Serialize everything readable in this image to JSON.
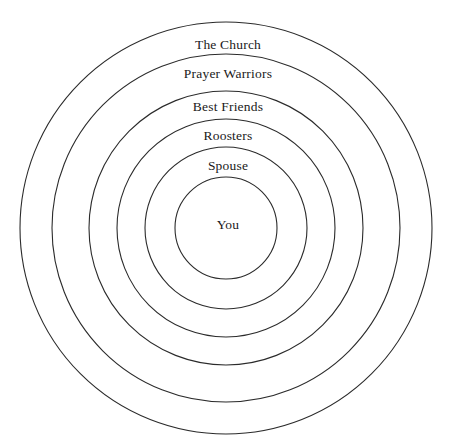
{
  "diagram": {
    "type": "concentric-circles",
    "background_color": "#ffffff",
    "stroke_color": "#2b2b2b",
    "stroke_width": 1.1,
    "text_color": "#1a1a1a",
    "center": {
      "x": 226,
      "y": 228
    },
    "rings": [
      {
        "index": 0,
        "label": "The Church",
        "radius": 206,
        "label_y": 38,
        "font_size": 13.5,
        "level": "outermost"
      },
      {
        "index": 1,
        "label": "Prayer Warriors",
        "radius": 174,
        "label_y": 67,
        "font_size": 13.5,
        "level": "second"
      },
      {
        "index": 2,
        "label": "Best Friends",
        "radius": 137,
        "label_y": 100,
        "font_size": 13.5,
        "level": "third"
      },
      {
        "index": 3,
        "label": "Roosters",
        "radius": 109,
        "label_y": 129,
        "font_size": 13.5,
        "level": "fourth"
      },
      {
        "index": 4,
        "label": "Spouse",
        "radius": 81,
        "label_y": 159,
        "font_size": 13.5,
        "level": "fifth"
      },
      {
        "index": 5,
        "label": "You",
        "radius": 51,
        "label_y": 218,
        "font_size": 13.5,
        "level": "innermost"
      }
    ]
  }
}
